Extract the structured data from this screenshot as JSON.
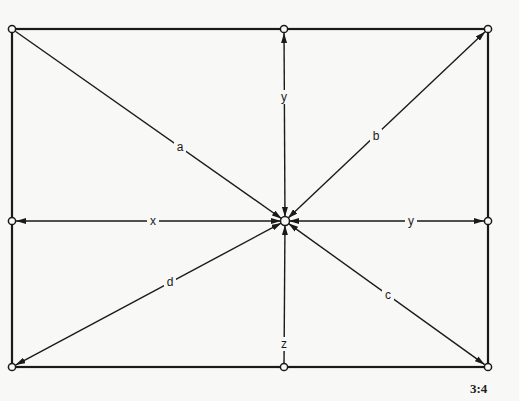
{
  "figure": {
    "caption": "3:4",
    "colors": {
      "ink": "#1a1a1a",
      "paper": "#f8f8f6"
    },
    "frame": {
      "x1": 12,
      "y1": 29,
      "x2": 488,
      "y2": 367
    },
    "center": {
      "x": 285,
      "y": 221
    },
    "nodes": [
      {
        "id": "top-left",
        "x": 12,
        "y": 29
      },
      {
        "id": "top-mid",
        "x": 284,
        "y": 29
      },
      {
        "id": "top-right",
        "x": 488,
        "y": 29
      },
      {
        "id": "left-mid",
        "x": 12,
        "y": 221
      },
      {
        "id": "center",
        "x": 285,
        "y": 221
      },
      {
        "id": "right-mid",
        "x": 488,
        "y": 221
      },
      {
        "id": "bottom-left",
        "x": 12,
        "y": 367
      },
      {
        "id": "bottom-mid",
        "x": 284,
        "y": 367
      },
      {
        "id": "bottom-right",
        "x": 488,
        "y": 367
      }
    ],
    "arrows": [
      {
        "label": "a",
        "from": "top-left",
        "to": "center",
        "heads": "end",
        "label_pos": {
          "x": 180,
          "y": 147
        }
      },
      {
        "label": "b",
        "from": "center",
        "to": "top-right",
        "heads": "both",
        "label_pos": {
          "x": 376,
          "y": 136
        }
      },
      {
        "label": "c",
        "from": "center",
        "to": "bottom-right",
        "heads": "both",
        "label_pos": {
          "x": 388,
          "y": 295
        }
      },
      {
        "label": "d",
        "from": "center",
        "to": "bottom-left",
        "heads": "both",
        "label_pos": {
          "x": 170,
          "y": 282
        }
      },
      {
        "label": "x",
        "from": "left-mid",
        "to": "center",
        "heads": "both",
        "label_pos": {
          "x": 153,
          "y": 221
        }
      },
      {
        "label": "y",
        "from": "center",
        "to": "right-mid",
        "heads": "both",
        "label_pos": {
          "x": 411,
          "y": 221
        }
      },
      {
        "label": "y",
        "from": "top-mid",
        "to": "center",
        "heads": "both",
        "label_pos": {
          "x": 284,
          "y": 97
        }
      },
      {
        "label": "z",
        "from": "bottom-mid",
        "to": "center",
        "heads": "end",
        "label_pos": {
          "x": 284,
          "y": 344
        }
      }
    ]
  }
}
